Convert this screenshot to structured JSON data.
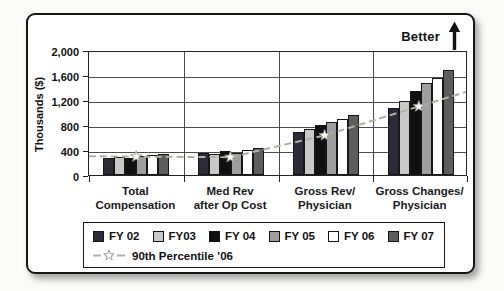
{
  "annotations": {
    "better_label": "Better"
  },
  "chart_data": {
    "type": "bar",
    "title": "",
    "xlabel": "",
    "ylabel": "Thousands ($)",
    "ylim": [
      0,
      2000
    ],
    "grid": true,
    "legend_position": "bottom",
    "yticks": [
      {
        "value": 0,
        "label": "0"
      },
      {
        "value": 400,
        "label": "400"
      },
      {
        "value": 800,
        "label": "800"
      },
      {
        "value": 1200,
        "label": "1,200"
      },
      {
        "value": 1600,
        "label": "1,600"
      },
      {
        "value": 2000,
        "label": "2,000"
      }
    ],
    "categories": [
      {
        "label": "Total Compensation",
        "label_lines": [
          "Total",
          "Compensation"
        ]
      },
      {
        "label": "Med Rev after Op Cost",
        "label_lines": [
          "Med Rev",
          "after Op Cost"
        ]
      },
      {
        "label": "Gross Rev/Physician",
        "label_lines": [
          "Gross Rev/",
          "Physician"
        ]
      },
      {
        "label": "Gross Changes/Physician",
        "label_lines": [
          "Gross Changes/",
          "Physician"
        ]
      }
    ],
    "series": [
      {
        "name": "FY 02",
        "color": "#2c2c38",
        "values": [
          265,
          350,
          690,
          1070
        ]
      },
      {
        "name": "FY03",
        "color": "#c9c9c9",
        "values": [
          295,
          330,
          740,
          1190
        ]
      },
      {
        "name": "FY 04",
        "color": "#101010",
        "values": [
          270,
          390,
          800,
          1340
        ]
      },
      {
        "name": "FY 05",
        "color": "#9e9e9e",
        "values": [
          305,
          360,
          845,
          1480
        ]
      },
      {
        "name": "FY 06",
        "color": "#ffffff",
        "values": [
          315,
          405,
          895,
          1560
        ]
      },
      {
        "name": "FY 07",
        "color": "#5d5d5d",
        "values": [
          330,
          430,
          955,
          1680
        ]
      }
    ],
    "percentile_line": {
      "name": "90th Percentile ’06",
      "values": [
        300,
        290,
        645,
        1115
      ],
      "color": "#b3afa3",
      "style": "dashed",
      "marker": "star"
    }
  }
}
